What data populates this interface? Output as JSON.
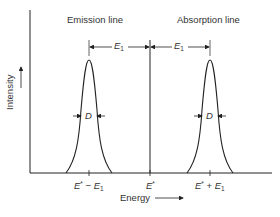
{
  "diagram": {
    "title_left": "Emission line",
    "title_right": "Absorption line",
    "y_axis_label": "Intensity",
    "x_axis_label": "Energy",
    "spacing_label": "E",
    "spacing_sub": "1",
    "width_label": "D",
    "ticks": [
      {
        "main": "E",
        "sup": "*",
        "op": " − ",
        "term": "E",
        "sub": "1"
      },
      {
        "main": "E",
        "sup": "*"
      },
      {
        "main": "E",
        "sup": "*",
        "op": " + ",
        "term": "E",
        "sub": "1"
      }
    ],
    "stroke_color": "#222222"
  }
}
